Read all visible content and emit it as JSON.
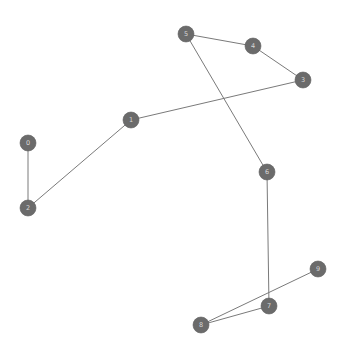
{
  "figure": {
    "title": "",
    "background_color": "#ffffff",
    "width": 343,
    "height": 352
  },
  "style": {
    "node_fill": "#6b6b6b",
    "node_stroke": "#5e5e5e",
    "node_radius": 8,
    "node_label_color": "#d8d8d8",
    "edge_color": "#7a7a7a",
    "edge_width": 1
  },
  "chart_data": {
    "type": "graph",
    "title": "",
    "xlabel": "",
    "ylabel": "",
    "grid": false,
    "axes_visible": false,
    "legend": false,
    "node_count": 10,
    "edge_count": 9,
    "component_count": 3,
    "nodes": [
      {
        "id": "0",
        "label": "0",
        "x": 28,
        "y": 143
      },
      {
        "id": "1",
        "label": "1",
        "x": 131,
        "y": 120
      },
      {
        "id": "2",
        "label": "2",
        "x": 28,
        "y": 208
      },
      {
        "id": "3",
        "label": "3",
        "x": 303,
        "y": 80
      },
      {
        "id": "4",
        "label": "4",
        "x": 253,
        "y": 46
      },
      {
        "id": "5",
        "label": "5",
        "x": 186,
        "y": 34
      },
      {
        "id": "6",
        "label": "6",
        "x": 267,
        "y": 172
      },
      {
        "id": "7",
        "label": "7",
        "x": 269,
        "y": 306
      },
      {
        "id": "8",
        "label": "8",
        "x": 201,
        "y": 325
      },
      {
        "id": "9",
        "label": "9",
        "x": 318,
        "y": 269
      }
    ],
    "edges": [
      {
        "source": "0",
        "target": "2"
      },
      {
        "source": "2",
        "target": "1"
      },
      {
        "source": "1",
        "target": "3"
      },
      {
        "source": "3",
        "target": "4"
      },
      {
        "source": "4",
        "target": "5"
      },
      {
        "source": "5",
        "target": "6"
      },
      {
        "source": "6",
        "target": "7"
      },
      {
        "source": "7",
        "target": "8"
      },
      {
        "source": "8",
        "target": "9"
      }
    ],
    "components": [
      {
        "name": "component-a",
        "nodes": [
          "0",
          "2",
          "1",
          "3",
          "4",
          "5",
          "6",
          "7",
          "8",
          "9"
        ]
      }
    ]
  }
}
